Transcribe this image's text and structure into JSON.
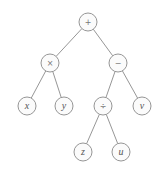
{
  "diagram": {
    "type": "expression-tree",
    "nodes": [
      {
        "id": "root",
        "label": "+",
        "kind": "operator",
        "cx": 88,
        "cy": 22
      },
      {
        "id": "mul",
        "label": "×",
        "kind": "operator",
        "cx": 50,
        "cy": 63
      },
      {
        "id": "sub",
        "label": "−",
        "kind": "operator",
        "cx": 118,
        "cy": 63
      },
      {
        "id": "x",
        "label": "x",
        "kind": "variable",
        "cx": 27,
        "cy": 106
      },
      {
        "id": "y",
        "label": "y",
        "kind": "variable",
        "cx": 64,
        "cy": 106
      },
      {
        "id": "div",
        "label": "÷",
        "kind": "operator",
        "cx": 103,
        "cy": 106
      },
      {
        "id": "v",
        "label": "v",
        "kind": "variable",
        "cx": 142,
        "cy": 106
      },
      {
        "id": "z",
        "label": "z",
        "kind": "variable",
        "cx": 83,
        "cy": 152
      },
      {
        "id": "u",
        "label": "u",
        "kind": "variable",
        "cx": 121,
        "cy": 152
      }
    ],
    "edges": [
      [
        "root",
        "mul"
      ],
      [
        "root",
        "sub"
      ],
      [
        "mul",
        "x"
      ],
      [
        "mul",
        "y"
      ],
      [
        "sub",
        "div"
      ],
      [
        "sub",
        "v"
      ],
      [
        "div",
        "z"
      ],
      [
        "div",
        "u"
      ]
    ],
    "node_radius": 9
  }
}
